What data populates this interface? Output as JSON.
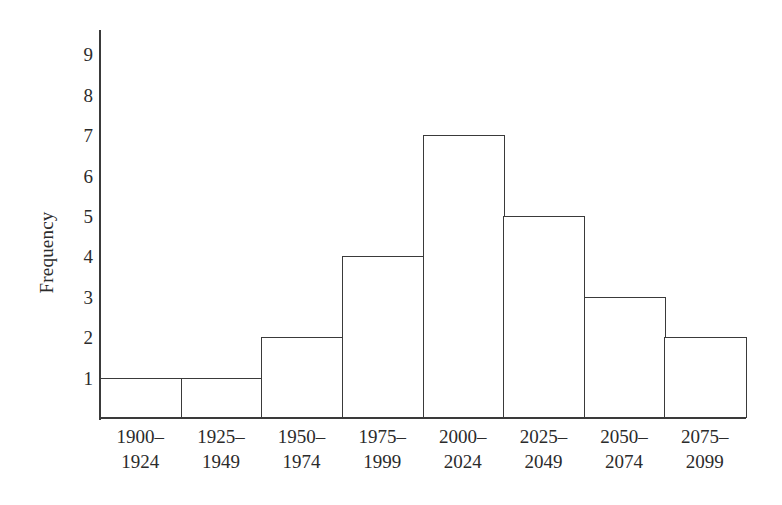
{
  "chart_data": {
    "type": "bar",
    "title": "",
    "subtitle": "",
    "xlabel": "",
    "ylabel": "Frequency",
    "categories": [
      "1900–1924",
      "1925–1949",
      "1950–1974",
      "1975–1999",
      "2000–2024",
      "2025–2049",
      "2050–2074",
      "2075–2099"
    ],
    "category_lines": [
      [
        "1900–",
        "1924"
      ],
      [
        "1925–",
        "1949"
      ],
      [
        "1950–",
        "1974"
      ],
      [
        "1975–",
        "1999"
      ],
      [
        "2000–",
        "2024"
      ],
      [
        "2025–",
        "2049"
      ],
      [
        "2050–",
        "2074"
      ],
      [
        "2075–",
        "2099"
      ]
    ],
    "values": [
      1,
      1,
      2,
      4,
      7,
      5,
      3,
      2
    ],
    "ylim": [
      0,
      9.6
    ],
    "yticks": [
      1,
      2,
      3,
      4,
      5,
      6,
      7,
      8,
      9
    ],
    "ytick_labels": [
      "1",
      "2",
      "3",
      "4",
      "5",
      "6",
      "7",
      "8",
      "9"
    ],
    "grid": false,
    "legend": false,
    "legend_position": "none",
    "bar_fill_color": "#ffffff",
    "bar_edge_color": "#3a3a3a",
    "axis_color": "#3a3a3a",
    "text_color": "#2b2b2b",
    "background_color": "#ffffff"
  }
}
